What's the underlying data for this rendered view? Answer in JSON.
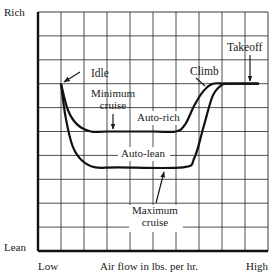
{
  "chart_data": {
    "type": "line",
    "title": "",
    "xlabel": "Air flow in lbs. per hr.",
    "ylabel": "",
    "x_tick_labels": {
      "low": "Low",
      "high": "High"
    },
    "y_tick_labels": {
      "high": "Rich",
      "low": "Lean"
    },
    "xlim": [
      0,
      10
    ],
    "ylim": [
      0,
      10
    ],
    "grid": true,
    "grid_divisions": {
      "x": 10,
      "y": 10
    },
    "series": [
      {
        "name": "Auto-rich",
        "points": [
          [
            1,
            7
          ],
          [
            1.3,
            5.9
          ],
          [
            1.7,
            5.3
          ],
          [
            2.3,
            5
          ],
          [
            3,
            5
          ],
          [
            5,
            5
          ],
          [
            6,
            5
          ],
          [
            6.4,
            5.3
          ],
          [
            6.8,
            6.1
          ],
          [
            7.2,
            6.7
          ],
          [
            7.6,
            7
          ],
          [
            8.2,
            7
          ],
          [
            9.6,
            7
          ]
        ]
      },
      {
        "name": "Auto-lean",
        "points": [
          [
            1,
            7
          ],
          [
            1.2,
            5.6
          ],
          [
            1.5,
            4.4
          ],
          [
            1.9,
            3.8
          ],
          [
            2.5,
            3.5
          ],
          [
            3.5,
            3.5
          ],
          [
            6.3,
            3.5
          ],
          [
            6.8,
            3.9
          ],
          [
            7.2,
            5.2
          ],
          [
            7.6,
            6.5
          ],
          [
            8,
            6.95
          ],
          [
            8.3,
            7
          ],
          [
            9.6,
            7
          ]
        ]
      }
    ],
    "annotations": [
      {
        "label": "Idle",
        "target": "start of curves (low air flow, rich mixture)"
      },
      {
        "label": "Minimum cruise",
        "target": "Auto-rich flat segment"
      },
      {
        "label": "Auto-rich",
        "target": "upper curve"
      },
      {
        "label": "Auto-lean",
        "target": "lower curve"
      },
      {
        "label": "Maximum cruise",
        "target": "Auto-lean flat segment"
      },
      {
        "label": "Climb",
        "target": "rising section joining top plateau"
      },
      {
        "label": "Takeoff",
        "target": "top plateau at high air flow"
      }
    ]
  }
}
